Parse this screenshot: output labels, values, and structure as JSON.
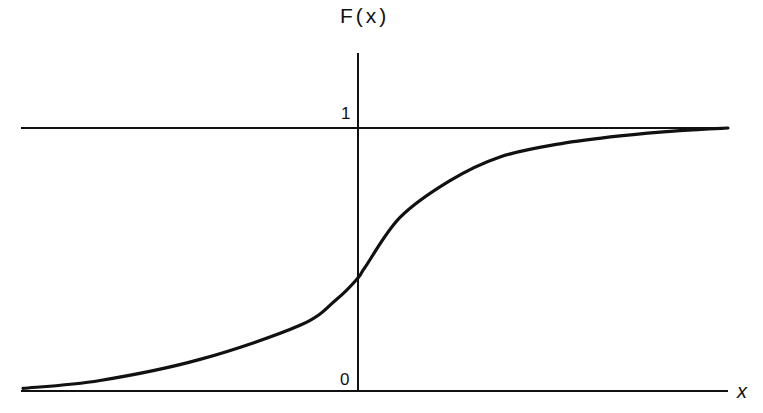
{
  "chart_data": {
    "type": "line",
    "title": "",
    "xlabel": "x",
    "ylabel": "F(x)",
    "y_ticks": [
      "0",
      "1"
    ],
    "grid": false,
    "legend": null,
    "annotations": [
      "Horizontal asymptote at F(x) = 1"
    ],
    "series": [
      {
        "name": "F(x)",
        "description": "Sigmoid-shaped cumulative distribution function rising from 0 to 1",
        "x_px": [
          23,
          100,
          200,
          300,
          337,
          358,
          365,
          400,
          450,
          500,
          560,
          620,
          680,
          728
        ],
        "values": [
          0.01,
          0.04,
          0.12,
          0.25,
          0.35,
          0.43,
          0.47,
          0.66,
          0.8,
          0.89,
          0.94,
          0.97,
          0.99,
          1.0
        ]
      }
    ],
    "ylim": [
      0,
      1
    ]
  },
  "labels": {
    "y_axis": "F(x)",
    "x_axis": "x",
    "tick_one": "1",
    "tick_zero": "0"
  }
}
